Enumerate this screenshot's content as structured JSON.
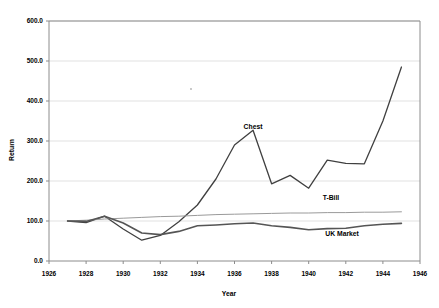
{
  "chart_data": {
    "type": "line",
    "title": "",
    "xlabel": "Year",
    "ylabel": "Return",
    "xlim": [
      1926,
      1946
    ],
    "ylim": [
      0,
      600
    ],
    "grid": true,
    "legend_position": "inline-right",
    "x_ticks": [
      "1926",
      "1928",
      "1930",
      "1932",
      "1934",
      "1936",
      "1938",
      "1940",
      "1942",
      "1944",
      "1946"
    ],
    "y_ticks": [
      "0.0",
      "100.0",
      "200.0",
      "300.0",
      "400.0",
      "500.0",
      "600.0"
    ],
    "x": [
      1927,
      1928,
      1929,
      1930,
      1931,
      1932,
      1933,
      1934,
      1935,
      1936,
      1937,
      1938,
      1939,
      1940,
      1941,
      1942,
      1943,
      1944,
      1945
    ],
    "series": [
      {
        "name": "Chest",
        "color": "#404040",
        "width": 1.3,
        "values": [
          100,
          96,
          112,
          80,
          52,
          64,
          98,
          140,
          205,
          290,
          327,
          193,
          214,
          182,
          252,
          244,
          243,
          350,
          485
        ]
      },
      {
        "name": "T-Bill",
        "color": "#9a9a9a",
        "width": 1.0,
        "values": [
          100,
          102,
          105,
          107,
          109,
          111,
          112,
          114,
          116,
          117,
          118,
          119,
          120,
          120,
          121,
          121,
          122,
          122,
          123
        ]
      },
      {
        "name": "UK Market",
        "color": "#555555",
        "width": 1.6,
        "values": [
          100,
          99,
          112,
          95,
          70,
          66,
          74,
          88,
          90,
          93,
          95,
          88,
          84,
          78,
          81,
          82,
          88,
          92,
          94
        ]
      }
    ],
    "annotations": [
      {
        "text": "Chest",
        "x": 1937.0,
        "y": 330
      },
      {
        "text": "T-Bill",
        "x": 1941.2,
        "y": 152
      },
      {
        "text": "UK Market",
        "x": 1941.8,
        "y": 62
      }
    ]
  }
}
